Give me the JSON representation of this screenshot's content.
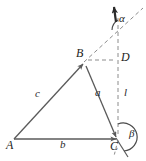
{
  "figure": {
    "kind": "geometry-vector-diagram",
    "background_color": "#ffffff",
    "stroke_color": "#5a5a5a",
    "dashed_color": "#8c8c8c",
    "text_color": "#1d1d1d",
    "vertices": [
      {
        "id": "A",
        "label": "A",
        "x": 13,
        "y": 140
      },
      {
        "id": "B",
        "label": "B",
        "x": 84,
        "y": 62
      },
      {
        "id": "C",
        "label": "C",
        "x": 118,
        "y": 140
      },
      {
        "id": "D",
        "label": "D",
        "x": 118,
        "y": 60
      }
    ],
    "sides": [
      {
        "id": "c",
        "label": "c",
        "from": "A",
        "to": "B"
      },
      {
        "id": "b",
        "label": "b",
        "from": "A",
        "to": "C"
      },
      {
        "id": "a",
        "label": "a",
        "from": "B",
        "to": "C"
      },
      {
        "id": "l",
        "label": "l",
        "from": "D",
        "to": "C"
      }
    ],
    "angles": [
      {
        "id": "alpha",
        "label": "α",
        "at": "ray-top",
        "x": 118,
        "y": 18
      },
      {
        "id": "beta",
        "label": "β",
        "at": "C",
        "x": 130,
        "y": 133
      }
    ],
    "side_label_positions": [
      {
        "id": "c",
        "label": "c",
        "x": 37,
        "y": 95
      },
      {
        "id": "b",
        "label": "b",
        "x": 62,
        "y": 144
      },
      {
        "id": "a",
        "label": "a",
        "x": 97,
        "y": 93
      },
      {
        "id": "l",
        "label": "l",
        "x": 124,
        "y": 93
      }
    ],
    "vertex_label_positions": [
      {
        "id": "A",
        "label": "A",
        "x": 8,
        "y": 143
      },
      {
        "id": "B",
        "label": "B",
        "x": 78,
        "y": 50
      },
      {
        "id": "C",
        "label": "C",
        "x": 113,
        "y": 143
      },
      {
        "id": "D",
        "label": "D",
        "x": 121,
        "y": 52
      }
    ]
  }
}
